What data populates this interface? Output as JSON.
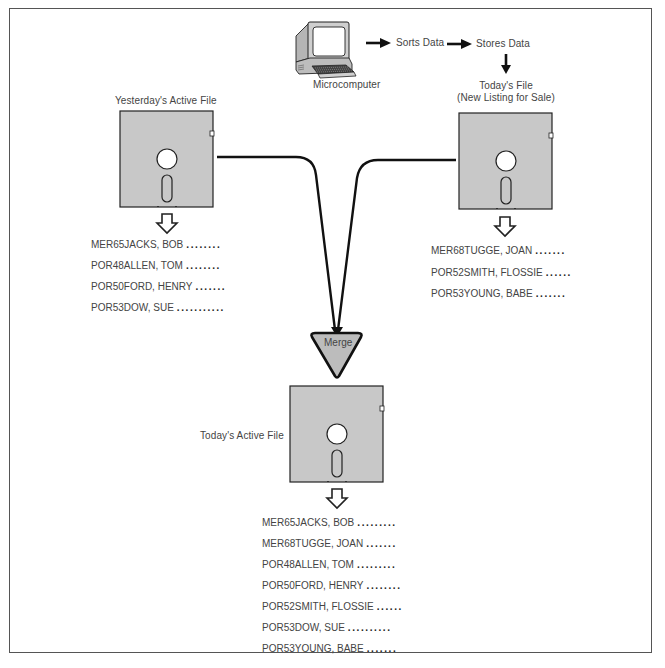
{
  "diagram": {
    "computer": {
      "icon": "microcomputer-icon",
      "label": "Microcomputer"
    },
    "flow": {
      "step1": "Sorts Data",
      "step2": "Stores Data"
    },
    "todays_file": {
      "title_line1": "Today's File",
      "title_line2": "(New Listing for Sale)",
      "icon": "floppy-disk-icon",
      "records": [
        {
          "name": "MER68TUGGE, JOAN",
          "dots": "......."
        },
        {
          "name": "POR52SMITH, FLOSSIE",
          "dots": "......"
        },
        {
          "name": "POR53YOUNG, BABE",
          "dots": "......."
        }
      ]
    },
    "yesterdays_file": {
      "title": "Yesterday's Active File",
      "icon": "floppy-disk-icon",
      "records": [
        {
          "name": "MER65JACKS, BOB",
          "dots": "........"
        },
        {
          "name": "POR48ALLEN, TOM",
          "dots": "........"
        },
        {
          "name": "POR50FORD, HENRY",
          "dots": "......."
        },
        {
          "name": "POR53DOW, SUE",
          "dots": "..........."
        }
      ]
    },
    "merge": {
      "label": "Merge",
      "icon": "merge-triangle-icon"
    },
    "active_file": {
      "title": "Today's Active File",
      "icon": "floppy-disk-icon",
      "records": [
        {
          "name": "MER65JACKS, BOB",
          "dots": "........."
        },
        {
          "name": "MER68TUGGE, JOAN",
          "dots": "......."
        },
        {
          "name": "POR48ALLEN, TOM",
          "dots": "........."
        },
        {
          "name": "POR50FORD, HENRY",
          "dots": "........"
        },
        {
          "name": "POR52SMITH, FLOSSIE",
          "dots": "......"
        },
        {
          "name": "POR53DOW, SUE",
          "dots": ".........."
        },
        {
          "name": "POR53YOUNG, BABE",
          "dots": "......."
        }
      ]
    },
    "colors": {
      "disk_fill": "#c8c8c8",
      "stroke": "#222222",
      "text": "#444444",
      "background": "#ffffff"
    }
  }
}
